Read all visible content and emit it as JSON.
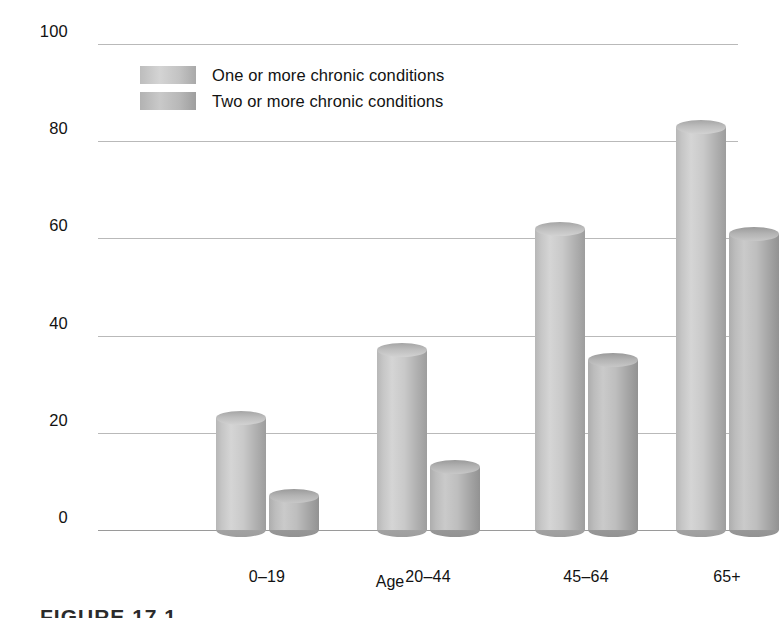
{
  "chart_data": {
    "type": "bar",
    "title": "",
    "xlabel": "Age",
    "ylabel": "Percent of population",
    "categories": [
      "0–19",
      "20–44",
      "45–64",
      "65+"
    ],
    "series": [
      {
        "name": "One or more chronic conditions",
        "values": [
          23,
          37,
          62,
          83
        ]
      },
      {
        "name": "Two or more chronic conditions",
        "values": [
          7,
          13,
          35,
          61
        ]
      }
    ],
    "ylim": [
      0,
      100
    ],
    "yticks": [
      0,
      20,
      40,
      60,
      80,
      100
    ],
    "ytick_labels": [
      "0",
      "20",
      "40",
      "60",
      "80",
      "100"
    ],
    "grid": "horizontal",
    "legend_position": "top-left-inside",
    "colors": {
      "series1": "#c8c8c8",
      "series2": "#b5b5b5",
      "gridline": "#b9b9b9",
      "axis": "#9a9a9a",
      "text": "#121212",
      "background": "#ffffff"
    }
  },
  "legend": {
    "items": [
      {
        "label": "One or more chronic conditions",
        "swatch": "series1"
      },
      {
        "label": "Two or more chronic conditions",
        "swatch": "series2"
      }
    ]
  },
  "caption": {
    "text": "FIGURE 17.1"
  }
}
